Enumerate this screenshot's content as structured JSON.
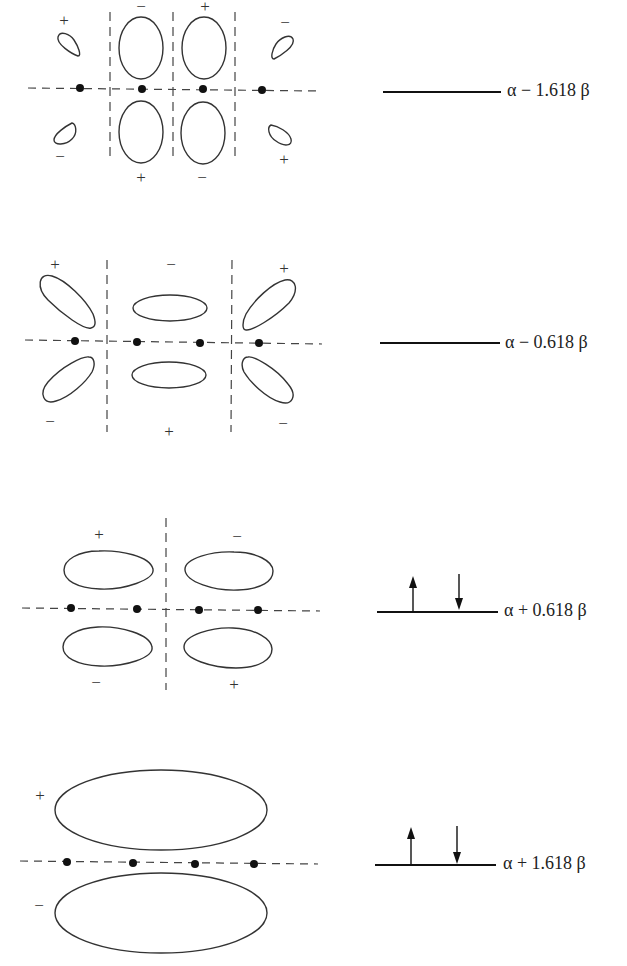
{
  "orbitals": [
    {
      "name": "psi4",
      "energy_label": "α − 1.618 β",
      "electrons": 0,
      "signs": {
        "top": [
          "+",
          "−",
          "+",
          "−"
        ],
        "bottom": [
          "−",
          "+",
          "−",
          "+"
        ]
      }
    },
    {
      "name": "psi3",
      "energy_label": "α − 0.618 β",
      "electrons": 0,
      "signs": {
        "top": [
          "+",
          "−",
          "+"
        ],
        "bottom": [
          "−",
          "+",
          "−"
        ]
      }
    },
    {
      "name": "psi2",
      "energy_label": "α + 0.618 β",
      "electrons": 2,
      "signs": {
        "top": [
          "+",
          "−"
        ],
        "bottom": [
          "−",
          "+"
        ]
      }
    },
    {
      "name": "psi1",
      "energy_label": "α + 1.618 β",
      "electrons": 2,
      "signs": {
        "top": [
          "+"
        ],
        "bottom": [
          "−"
        ]
      }
    }
  ],
  "colors": {
    "line": "#333333",
    "atom": "#111111",
    "background": "#ffffff"
  }
}
